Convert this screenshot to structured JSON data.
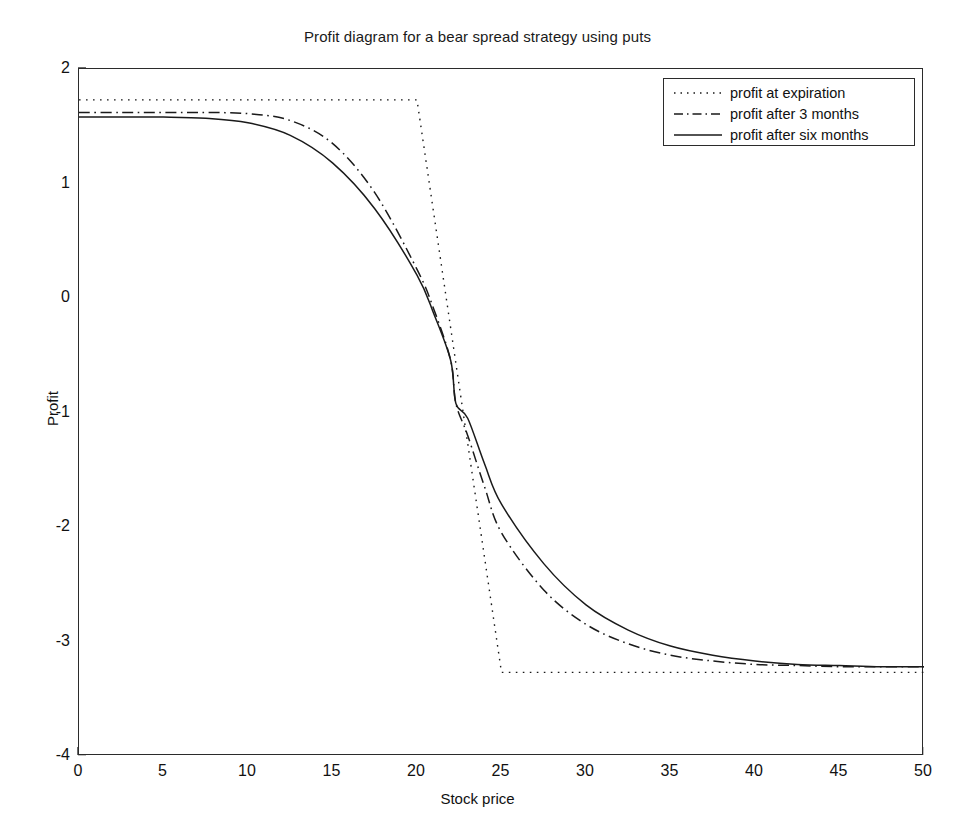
{
  "chart_data": {
    "type": "line",
    "title": "Profit diagram for a bear spread strategy using puts",
    "xlabel": "Stock price",
    "ylabel": "Profit",
    "xlim": [
      0,
      50
    ],
    "ylim": [
      -4,
      2
    ],
    "xticks": [
      0,
      5,
      10,
      15,
      20,
      25,
      30,
      35,
      40,
      45,
      50
    ],
    "yticks": [
      2,
      1,
      0,
      -1,
      -2,
      -3,
      -4
    ],
    "grid": false,
    "legend_position": "upper right",
    "series": [
      {
        "name": "profit at expiration",
        "style": "dotted",
        "color": "#1a1a1a",
        "x": [
          0,
          5,
          10,
          15,
          20,
          21,
          22,
          23,
          24,
          25,
          30,
          35,
          40,
          45,
          50
        ],
        "y": [
          1.73,
          1.73,
          1.73,
          1.73,
          1.73,
          0.73,
          -0.27,
          -1.27,
          -2.27,
          -3.27,
          -3.27,
          -3.27,
          -3.27,
          -3.27,
          -3.27
        ]
      },
      {
        "name": "profit after 3 months",
        "style": "dash-dot",
        "color": "#1a1a1a",
        "x": [
          0,
          2.5,
          5,
          7.5,
          10,
          12.5,
          15,
          17.5,
          20,
          21,
          22,
          22.3,
          23,
          24,
          25,
          27.5,
          30,
          32.5,
          35,
          37.5,
          40,
          42.5,
          45,
          47.5,
          50
        ],
        "y": [
          1.62,
          1.62,
          1.62,
          1.62,
          1.61,
          1.55,
          1.35,
          0.92,
          0.25,
          -0.1,
          -0.55,
          -0.92,
          -1.2,
          -1.65,
          -2.05,
          -2.55,
          -2.85,
          -3.02,
          -3.12,
          -3.17,
          -3.2,
          -3.21,
          -3.22,
          -3.22,
          -3.22
        ]
      },
      {
        "name": "profit after six months",
        "style": "solid",
        "color": "#1a1a1a",
        "x": [
          0,
          2.5,
          5,
          7.5,
          10,
          12.5,
          15,
          17.5,
          20,
          21,
          22,
          22.3,
          23,
          24,
          25,
          27.5,
          30,
          32.5,
          35,
          37.5,
          40,
          42.5,
          45,
          47.5,
          50
        ],
        "y": [
          1.58,
          1.58,
          1.58,
          1.57,
          1.53,
          1.42,
          1.18,
          0.78,
          0.2,
          -0.14,
          -0.55,
          -0.92,
          -1.05,
          -1.45,
          -1.8,
          -2.32,
          -2.68,
          -2.9,
          -3.04,
          -3.12,
          -3.17,
          -3.2,
          -3.21,
          -3.22,
          -3.22
        ]
      }
    ]
  },
  "legend": {
    "items": [
      {
        "label": "profit at expiration",
        "style": "dotted"
      },
      {
        "label": "profit after 3 months",
        "style": "dash-dot"
      },
      {
        "label": "profit after six months",
        "style": "solid"
      }
    ]
  },
  "colors": {
    "axis": "#2b2b2b",
    "line": "#1a1a1a",
    "background": "#ffffff"
  }
}
